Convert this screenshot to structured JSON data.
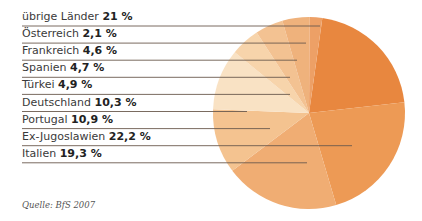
{
  "chart_data": {
    "type": "pie",
    "title": "",
    "legend_position": "left",
    "source": "Quelle: BfS 2007",
    "categories": [
      "übrige Länder",
      "Österreich",
      "Frankreich",
      "Spanien",
      "Türkei",
      "Deutschland",
      "Portugal",
      "Ex-Jugoslawien",
      "Italien"
    ],
    "values": [
      21,
      2.1,
      4.6,
      4.7,
      4.9,
      10.3,
      10.9,
      22.2,
      19.3
    ],
    "value_labels": [
      "21 %",
      "2,1 %",
      "4,6 %",
      "4,7 %",
      "4,9 %",
      "10,3 %",
      "10,9 %",
      "22,2 %",
      "19,3 %"
    ],
    "colors": [
      "#e98b45",
      "#eda066",
      "#f0b27c",
      "#f4c596",
      "#f7d6ae",
      "#fae6cb",
      "#f6cf9f",
      "#f1b57b",
      "#eba368",
      "#ec9a58"
    ]
  },
  "slices": [
    {
      "name": "übrige Länder",
      "value": 21,
      "color": "#e8873f"
    },
    {
      "name": "Ex-Jugoslawien",
      "value": 22.2,
      "color": "#ed9a55"
    },
    {
      "name": "Italien",
      "value": 19.3,
      "color": "#f0ad73"
    },
    {
      "name": "Portugal",
      "value": 10.9,
      "color": "#f4c390"
    },
    {
      "name": "Deutschland",
      "value": 10.3,
      "color": "#f9e2c4"
    },
    {
      "name": "Türkei",
      "value": 4.9,
      "color": "#f7d4ab"
    },
    {
      "name": "Spanien",
      "value": 4.7,
      "color": "#f3c292"
    },
    {
      "name": "Frankreich",
      "value": 4.6,
      "color": "#efb27c"
    },
    {
      "name": "Österreich",
      "value": 2.1,
      "color": "#eda066"
    }
  ],
  "rows": [
    {
      "label": "übrige Länder",
      "value": "21 %",
      "lineEnd": 320
    },
    {
      "label": "Österreich",
      "value": "2,1 %",
      "lineEnd": 306
    },
    {
      "label": "Frankreich",
      "value": "4,6 %",
      "lineEnd": 297
    },
    {
      "label": "Spanien",
      "value": "4,7 %",
      "lineEnd": 290
    },
    {
      "label": "Türkei",
      "value": "4,9 %",
      "lineEnd": 290
    },
    {
      "label": "Deutschland",
      "value": "10,3 %",
      "lineEnd": 247
    },
    {
      "label": "Portugal",
      "value": "10,9 %",
      "lineEnd": 270
    },
    {
      "label": "Ex-Jugoslawien",
      "value": "22,2 %",
      "lineEnd": 352
    },
    {
      "label": "Italien",
      "value": "19,3 %",
      "lineEnd": 307
    }
  ],
  "source": "Quelle: BfS 2007"
}
